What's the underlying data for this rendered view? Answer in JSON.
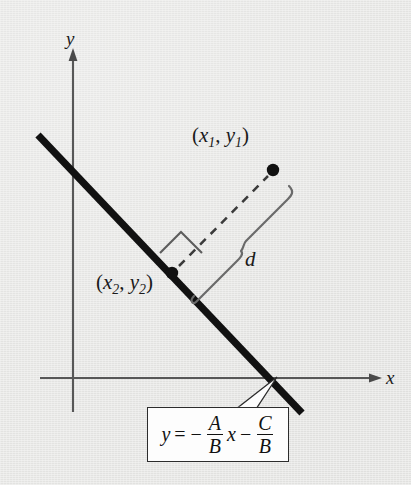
{
  "figure": {
    "background_color": "#e9e9e7",
    "ink_color": "#1a1a1a"
  },
  "axes": {
    "x_label": "x",
    "y_label": "y",
    "origin": [
      73,
      378
    ]
  },
  "labels": {
    "point1_prefix": "(",
    "point1_x": "x",
    "point1_xsub": "1",
    "point1_comma": ", ",
    "point1_y": "y",
    "point1_ysub": "1",
    "point1_suffix": ")",
    "point2_prefix": "(",
    "point2_x": "x",
    "point2_xsub": "2",
    "point2_comma": ", ",
    "point2_y": "y",
    "point2_ysub": "2",
    "point2_suffix": ")",
    "distance": "d"
  },
  "equation": {
    "lhs": "y",
    "equals": "=",
    "minus1": "−",
    "frac1_num": "A",
    "frac1_den": "B",
    "variable": "x",
    "minus2": "−",
    "frac2_num": "C",
    "frac2_den": "B",
    "full_text": "y = − A/B x − C/B"
  },
  "geometry": {
    "line_start": [
      38,
      135
    ],
    "line_end": [
      302,
      413
    ],
    "point1": [
      273,
      170
    ],
    "point2": [
      172,
      273
    ],
    "right_angle_marker": true,
    "perpendicular_dashed": true,
    "brace_label": "d"
  }
}
